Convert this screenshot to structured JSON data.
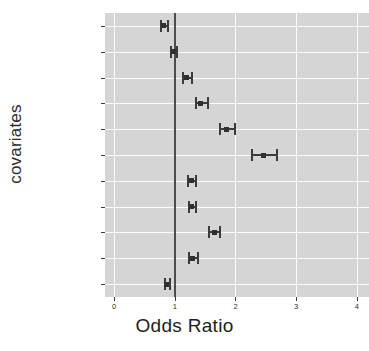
{
  "chart_data": {
    "type": "scatter",
    "plot_kind": "forest-plot",
    "title": "",
    "xlabel": "Odds Ratio",
    "ylabel": "covariates",
    "xlim": [
      -0.15,
      4.2
    ],
    "xticks": [
      0,
      1,
      2,
      3,
      4
    ],
    "xtick_labels": [
      "0",
      "1",
      "2",
      "3",
      "4"
    ],
    "reference_line": 1,
    "grid": true,
    "legend": "none",
    "categories": [
      "Age: <18",
      "Age: 18-19",
      "Wealth Quintile: 2nd",
      "Wealth Quintile: 3rd",
      "Wealth Quintile: 4th",
      "Wealth Quintile: 5th",
      "Residence: Urban",
      "Education:Primary",
      "Education: Secondary",
      "first time mother",
      "child bride"
    ],
    "points": [
      {
        "label": "Age: <18",
        "estimate": 0.82,
        "ci_low": 0.76,
        "ci_high": 0.9
      },
      {
        "label": "Age: 18-19",
        "estimate": 0.98,
        "ci_low": 0.92,
        "ci_high": 1.05
      },
      {
        "label": "Wealth Quintile: 2nd",
        "estimate": 1.19,
        "ci_low": 1.12,
        "ci_high": 1.3
      },
      {
        "label": "Wealth Quintile: 3rd",
        "estimate": 1.43,
        "ci_low": 1.34,
        "ci_high": 1.57
      },
      {
        "label": "Wealth Quintile: 4th",
        "estimate": 1.86,
        "ci_low": 1.73,
        "ci_high": 2.01
      },
      {
        "label": "Wealth Quintile: 5th",
        "estimate": 2.47,
        "ci_low": 2.26,
        "ci_high": 2.7
      },
      {
        "label": "Residence: Urban",
        "estimate": 1.27,
        "ci_low": 1.2,
        "ci_high": 1.37
      },
      {
        "label": "Education:Primary",
        "estimate": 1.28,
        "ci_low": 1.21,
        "ci_high": 1.36
      },
      {
        "label": "Education: Secondary",
        "estimate": 1.65,
        "ci_low": 1.55,
        "ci_high": 1.76
      },
      {
        "label": "first time mother",
        "estimate": 1.3,
        "ci_low": 1.22,
        "ci_high": 1.4
      },
      {
        "label": "child bride",
        "estimate": 0.87,
        "ci_low": 0.83,
        "ci_high": 0.93
      }
    ],
    "colors": {
      "panel_background": "#d5d5d5",
      "gridline": "#fbfbfb",
      "reference_line": "#4d4d4d",
      "point": "#303030",
      "whisker": "#3b3b3b",
      "text": "#2e2e2e",
      "figure_background": "#ffffff"
    }
  }
}
